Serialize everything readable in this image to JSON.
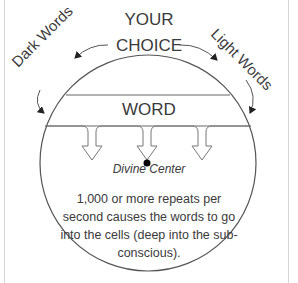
{
  "diagram": {
    "top_label_line1": "YOUR",
    "top_label_line2": "CHOICE",
    "left_arrow_label": "Dark Words",
    "right_arrow_label": "Light Words",
    "band_label": "WORD",
    "center_label": "Divine Center",
    "description": "1,000 or more repeats per second causes the words to go into the cells (deep into the sub-conscious).",
    "arrow_count": 3,
    "colors": {
      "stroke": "#555555",
      "text": "#3a3a3a",
      "frame": "#d6d6d6",
      "center_dot": "#000000"
    }
  }
}
